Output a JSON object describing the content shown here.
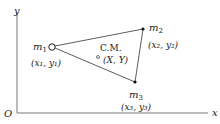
{
  "axes": {
    "x_label": "x",
    "y_label": "y",
    "origin_label": "O"
  },
  "masses": [
    {
      "name": "m",
      "sub": "1",
      "coord": "(x₁, y₁)"
    },
    {
      "name": "m",
      "sub": "2",
      "coord": "(x₂, y₂)"
    },
    {
      "name": "m",
      "sub": "3",
      "coord": "(x₃, y₃)"
    }
  ],
  "center_of_mass": {
    "label": "C.M.",
    "coord": "(X, Y)"
  },
  "colors": {
    "line": "#333333",
    "text": "#222222"
  }
}
